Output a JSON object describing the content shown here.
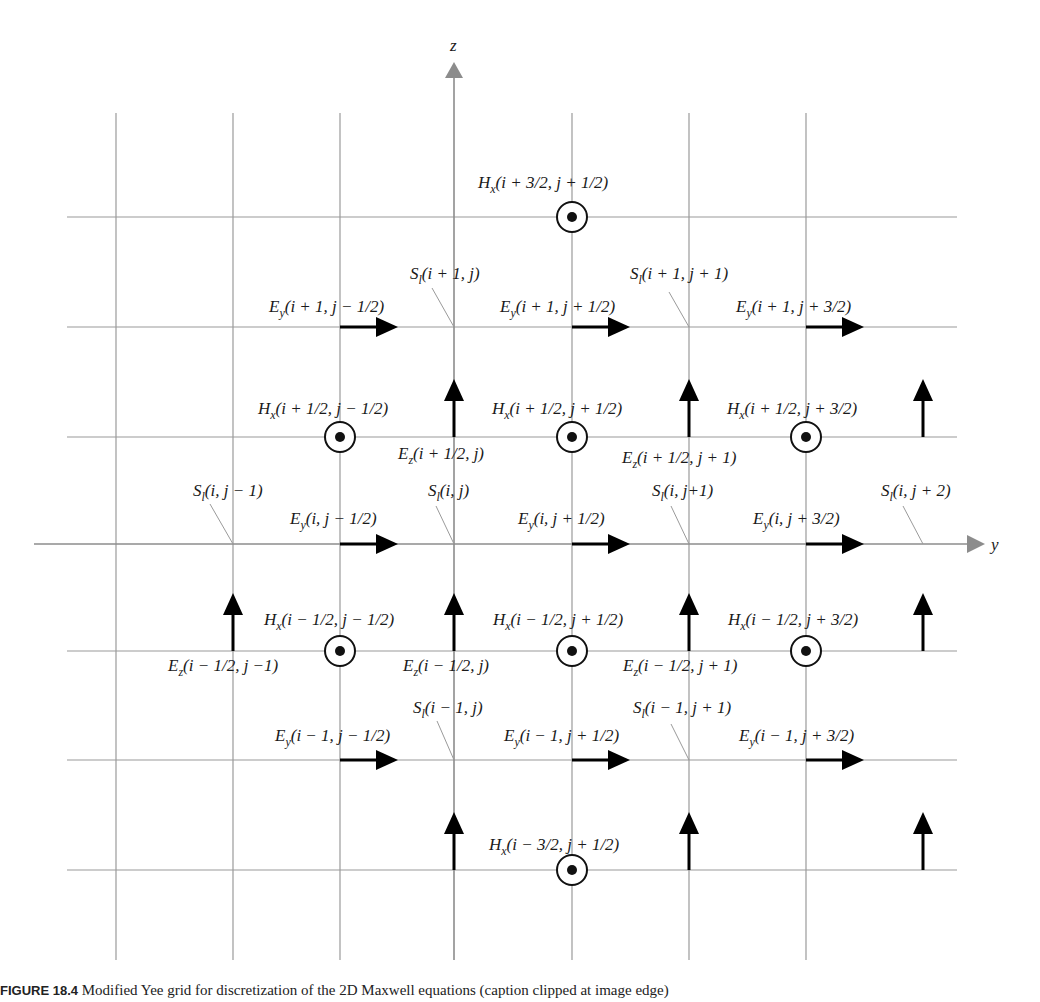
{
  "figure": {
    "caption_label": "FIGURE 18.4",
    "caption_text": "Modified Yee grid for discretization of the 2D Maxwell equations (caption clipped at image edge)",
    "axes": {
      "z_label": "z",
      "y_label": "y"
    },
    "colors": {
      "grid": "#9a9a9a",
      "axis": "#8c8c8c",
      "arrow": "#000000",
      "leader": "#9a9a9a"
    }
  },
  "grid": {
    "vertical_x": [
      116,
      233,
      340,
      454,
      572,
      689,
      806
    ],
    "horizontal_y": [
      217,
      327,
      437,
      544,
      651,
      760,
      870
    ],
    "v_top": 113,
    "v_bottom": 960,
    "h_left": 67,
    "h_right": 957,
    "z_axis": {
      "x": 454,
      "top": 62,
      "bottom": 960
    },
    "y_axis": {
      "y": 544,
      "left": 34,
      "right": 985
    }
  },
  "labels": {
    "hx": [
      {
        "text_main": "H",
        "sub": "x",
        "args": "(i + 3/2, j + 1/2)",
        "x": 478,
        "y": 188,
        "cx": 572,
        "cy": 217
      },
      {
        "text_main": "H",
        "sub": "x",
        "args": "(i + 1/2, j − 1/2)",
        "x": 258,
        "y": 414,
        "cx": 340,
        "cy": 437
      },
      {
        "text_main": "H",
        "sub": "x",
        "args": "(i + 1/2, j + 1/2)",
        "x": 492,
        "y": 414,
        "cx": 572,
        "cy": 437
      },
      {
        "text_main": "H",
        "sub": "x",
        "args": "(i + 1/2, j + 3/2)",
        "x": 727,
        "y": 414,
        "cx": 806,
        "cy": 437
      },
      {
        "text_main": "H",
        "sub": "x",
        "args": "(i − 1/2, j − 1/2)",
        "x": 264,
        "y": 625,
        "cx": 340,
        "cy": 651
      },
      {
        "text_main": "H",
        "sub": "x",
        "args": "(i − 1/2, j + 1/2)",
        "x": 493,
        "y": 625,
        "cx": 572,
        "cy": 651
      },
      {
        "text_main": "H",
        "sub": "x",
        "args": "(i − 1/2, j + 3/2)",
        "x": 728,
        "y": 625,
        "cx": 806,
        "cy": 651
      },
      {
        "text_main": "H",
        "sub": "x",
        "args": "(i − 3/2, j + 1/2)",
        "x": 489,
        "y": 850,
        "cx": 572,
        "cy": 870
      }
    ],
    "ey": [
      {
        "text_main": "E",
        "sub": "y",
        "args": "(i + 1, j − 1/2)",
        "x": 269,
        "y": 312,
        "ax": 340,
        "ay": 327
      },
      {
        "text_main": "E",
        "sub": "y",
        "args": "(i + 1, j + 1/2)",
        "x": 500,
        "y": 312,
        "ax": 572,
        "ay": 327
      },
      {
        "text_main": "E",
        "sub": "y",
        "args": "(i + 1, j + 3/2)",
        "x": 736,
        "y": 312,
        "ax": 806,
        "ay": 327
      },
      {
        "text_main": "E",
        "sub": "y",
        "args": "(i, j − 1/2)",
        "x": 290,
        "y": 524,
        "ax": 340,
        "ay": 544
      },
      {
        "text_main": "E",
        "sub": "y",
        "args": "(i, j + 1/2)",
        "x": 518,
        "y": 524,
        "ax": 572,
        "ay": 544
      },
      {
        "text_main": "E",
        "sub": "y",
        "args": "(i, j + 3/2)",
        "x": 753,
        "y": 524,
        "ax": 806,
        "ay": 544
      },
      {
        "text_main": "E",
        "sub": "y",
        "args": "(i − 1, j − 1/2)",
        "x": 275,
        "y": 741,
        "ax": 340,
        "ay": 760
      },
      {
        "text_main": "E",
        "sub": "y",
        "args": "(i − 1, j + 1/2)",
        "x": 504,
        "y": 741,
        "ax": 572,
        "ay": 760
      },
      {
        "text_main": "E",
        "sub": "y",
        "args": "(i − 1, j + 3/2)",
        "x": 739,
        "y": 741,
        "ax": 806,
        "ay": 760
      }
    ],
    "ez": [
      {
        "text_main": "E",
        "sub": "z",
        "args": "(i + 1/2, j)",
        "x": 398,
        "y": 459,
        "ax": 454,
        "ay": 437
      },
      {
        "text_main": "E",
        "sub": "z",
        "args": "(i + 1/2, j + 1)",
        "x": 622,
        "y": 463,
        "ax": 689,
        "ay": 437
      },
      {
        "text_main": "E",
        "sub": "z",
        "args": "(i − 1/2, j −1)",
        "x": 168,
        "y": 671,
        "ax": 233,
        "ay": 651
      },
      {
        "text_main": "E",
        "sub": "z",
        "args": "(i − 1/2, j)",
        "x": 403,
        "y": 671,
        "ax": 454,
        "ay": 651
      },
      {
        "text_main": "E",
        "sub": "z",
        "args": "(i − 1/2, j + 1)",
        "x": 623,
        "y": 671,
        "ax": 689,
        "ay": 651
      }
    ],
    "ez_unlabeled": [
      {
        "ax": 923,
        "ay": 437
      },
      {
        "ax": 923,
        "ay": 651
      },
      {
        "ax": 454,
        "ay": 870
      },
      {
        "ax": 689,
        "ay": 870
      },
      {
        "ax": 923,
        "ay": 870
      }
    ],
    "sl": [
      {
        "text_main": "S",
        "sub": "l",
        "args": "(i + 1, j)",
        "x": 410,
        "y": 279,
        "px": 454,
        "py": 327,
        "lx": 432,
        "ly": 288
      },
      {
        "text_main": "S",
        "sub": "l",
        "args": "(i + 1, j + 1)",
        "x": 630,
        "y": 279,
        "px": 689,
        "py": 327,
        "lx": 669,
        "ly": 292
      },
      {
        "text_main": "S",
        "sub": "l",
        "args": "(i, j − 1)",
        "x": 193,
        "y": 496,
        "px": 233,
        "py": 544,
        "lx": 210,
        "ly": 504
      },
      {
        "text_main": "S",
        "sub": "l",
        "args": "(i, j)",
        "x": 428,
        "y": 496,
        "px": 454,
        "py": 544,
        "lx": 436,
        "ly": 506
      },
      {
        "text_main": "S",
        "sub": "l",
        "args": "(i, j+1)",
        "x": 652,
        "y": 496,
        "px": 689,
        "py": 544,
        "lx": 671,
        "ly": 506
      },
      {
        "text_main": "S",
        "sub": "l",
        "args": "(i, j + 2)",
        "x": 881,
        "y": 496,
        "px": 923,
        "py": 544,
        "lx": 903,
        "ly": 506
      },
      {
        "text_main": "S",
        "sub": "l",
        "args": "(i − 1, j)",
        "x": 413,
        "y": 713,
        "px": 454,
        "py": 760,
        "lx": 437,
        "ly": 721
      },
      {
        "text_main": "S",
        "sub": "l",
        "args": "(i − 1, j + 1)",
        "x": 633,
        "y": 713,
        "px": 689,
        "py": 760,
        "lx": 671,
        "ly": 724
      }
    ]
  }
}
